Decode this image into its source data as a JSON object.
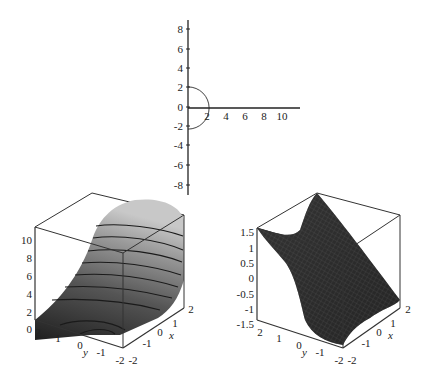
{
  "chart_data": [
    {
      "type": "line",
      "title": "",
      "description": "Conformal grid image (polar-like mesh) in a semi-annular region, right half-plane",
      "xlabel": "",
      "ylabel": "",
      "xlim": [
        0,
        11.5
      ],
      "ylim": [
        -9,
        9
      ],
      "x_ticks": [
        "2",
        "4",
        "6",
        "8",
        "10"
      ],
      "y_ticks": [
        "8",
        "6",
        "4",
        "2",
        "0",
        "-2",
        "-4",
        "-6",
        "-8"
      ],
      "grid": false,
      "region": {
        "inner_radius": 2.2,
        "outer_radius": 11.3,
        "angle_range_deg": [
          -90,
          90
        ]
      },
      "mesh": {
        "radial_lines": 15,
        "circular_arcs": 16
      }
    },
    {
      "type": "surface",
      "title": "",
      "description": "3D shaded surface with contour lines, grayscale",
      "xlabel": "x",
      "ylabel": "y",
      "zlabel": "",
      "x_ticks": [
        "-2",
        "-1",
        "0",
        "1",
        "2"
      ],
      "y_ticks": [
        "2",
        "1",
        "0",
        "-1",
        "-2"
      ],
      "z_ticks": [
        "0",
        "2",
        "4",
        "6",
        "8",
        "10"
      ],
      "xlim": [
        -2,
        2
      ],
      "ylim": [
        -2,
        2
      ],
      "zlim": [
        0,
        11
      ]
    },
    {
      "type": "surface",
      "title": "",
      "description": "3D mesh surface, dark grayscale, saddle-like descending sheet",
      "xlabel": "x",
      "ylabel": "y",
      "zlabel": "",
      "x_ticks": [
        "-2",
        "-1",
        "0",
        "1",
        "2"
      ],
      "y_ticks": [
        "2",
        "1",
        "0",
        "-1",
        "-2"
      ],
      "z_ticks": [
        "1.5",
        "1",
        "0.5",
        "0",
        "-0.5",
        "-1",
        "-1.5"
      ],
      "xlim": [
        -2,
        2
      ],
      "ylim": [
        -2,
        2
      ],
      "zlim": [
        -1.5,
        1.5
      ]
    }
  ],
  "plot1": {
    "y_ticks": [
      {
        "label": "8",
        "y": 33
      },
      {
        "label": "6",
        "y": 53
      },
      {
        "label": "4",
        "y": 72
      },
      {
        "label": "2",
        "y": 91
      },
      {
        "label": "0",
        "y": 111
      },
      {
        "label": "-2",
        "y": 130
      },
      {
        "label": "-4",
        "y": 149
      },
      {
        "label": "-6",
        "y": 169
      },
      {
        "label": "-8",
        "y": 189
      }
    ],
    "x_ticks": [
      {
        "label": "2",
        "x": 207
      },
      {
        "label": "4",
        "x": 226
      },
      {
        "label": "6",
        "x": 245
      },
      {
        "label": "8",
        "x": 264
      },
      {
        "label": "10",
        "x": 282
      }
    ]
  },
  "plot2": {
    "z_ticks": [
      "10",
      "8",
      "6",
      "4",
      "2",
      "0"
    ],
    "y_ticks": [
      "2",
      "1",
      "0",
      "-1",
      "-2"
    ],
    "x_ticks": [
      "-2",
      "-1",
      "0",
      "1",
      "2"
    ],
    "x_label": "x",
    "y_label": "y"
  },
  "plot3": {
    "z_ticks": [
      "1.5",
      "1",
      "0.5",
      "0",
      "-0.5",
      "-1",
      "-1.5"
    ],
    "y_ticks": [
      "2",
      "1",
      "0",
      "-1",
      "-2"
    ],
    "x_ticks": [
      "-2",
      "-1",
      "0",
      "1",
      "2"
    ],
    "x_label": "x",
    "y_label": "y"
  },
  "colors": {
    "axis": "#222222",
    "grid": "#555555",
    "surface_dark": "#2a2a2a",
    "surface_light": "#bdbdbd"
  }
}
